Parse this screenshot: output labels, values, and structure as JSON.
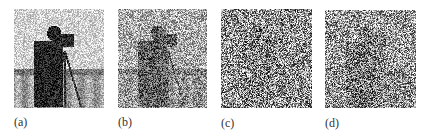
{
  "figure": {
    "panels": [
      {
        "id": "a",
        "label": "(a)",
        "description": "Cameraman image with additive noise (subject clearly visible)",
        "noise_level": 0.35,
        "signal": 1.0,
        "x": 14,
        "y": 9,
        "w": 90,
        "h": 99,
        "label_x": 14,
        "label_y": 115
      },
      {
        "id": "b",
        "label": "(b)",
        "description": "Cameraman image with heavier noise (subject faintly visible)",
        "noise_level": 0.6,
        "signal": 0.45,
        "x": 118,
        "y": 9,
        "w": 89,
        "h": 99,
        "label_x": 118,
        "label_y": 115
      },
      {
        "id": "c",
        "label": "(c)",
        "description": "Image dominated by noise (subject nearly invisible)",
        "noise_level": 0.85,
        "signal": 0.08,
        "x": 221,
        "y": 9,
        "w": 91,
        "h": 99,
        "label_x": 221,
        "label_y": 116
      },
      {
        "id": "d",
        "label": "(d)",
        "description": "Noisy image with faint subject outline",
        "noise_level": 0.8,
        "signal": 0.18,
        "x": 325,
        "y": 10,
        "w": 91,
        "h": 98,
        "label_x": 325,
        "label_y": 116
      }
    ]
  }
}
